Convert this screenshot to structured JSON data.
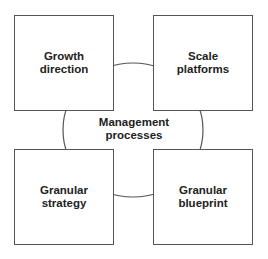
{
  "diagram": {
    "center": {
      "label": "Management\nprocesses"
    },
    "boxes": [
      {
        "id": "top-left",
        "label": "Growth\ndirection"
      },
      {
        "id": "top-right",
        "label": "Scale\nplatforms"
      },
      {
        "id": "bottom-left",
        "label": "Granular\nstrategy"
      },
      {
        "id": "bottom-right",
        "label": "Granular\nblueprint"
      }
    ],
    "colors": {
      "stroke": "#555555",
      "text": "#222222",
      "background": "#ffffff"
    }
  }
}
